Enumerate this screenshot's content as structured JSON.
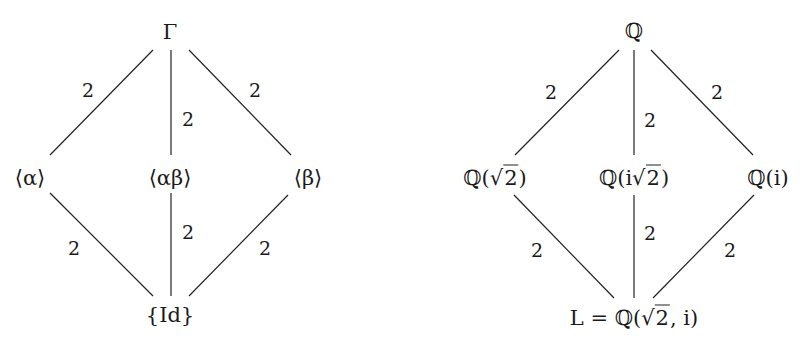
{
  "diagrams": [
    {
      "name": "galois-group-lattice",
      "nodes": {
        "top": "Γ",
        "left": "⟨α⟩",
        "middle": "⟨αβ⟩",
        "right": "⟨β⟩",
        "bottom": "{Id}"
      },
      "edges": [
        {
          "from": "top",
          "to": "left",
          "label": "2"
        },
        {
          "from": "top",
          "to": "middle",
          "label": "2"
        },
        {
          "from": "top",
          "to": "right",
          "label": "2"
        },
        {
          "from": "left",
          "to": "bottom",
          "label": "2"
        },
        {
          "from": "middle",
          "to": "bottom",
          "label": "2"
        },
        {
          "from": "right",
          "to": "bottom",
          "label": "2"
        }
      ]
    },
    {
      "name": "field-extension-lattice",
      "nodes": {
        "top": "ℚ",
        "left_prefix": "ℚ(",
        "left_rad": "2",
        "left_suffix": ")",
        "middle_prefix": "ℚ(i",
        "middle_rad": "2",
        "middle_suffix": ")",
        "right": "ℚ(i)",
        "bottom_prefix": "L = ℚ(",
        "bottom_rad": "2",
        "bottom_suffix": ", i)"
      },
      "edges": [
        {
          "from": "top",
          "to": "left",
          "label": "2"
        },
        {
          "from": "top",
          "to": "middle",
          "label": "2"
        },
        {
          "from": "top",
          "to": "right",
          "label": "2"
        },
        {
          "from": "left",
          "to": "bottom",
          "label": "2"
        },
        {
          "from": "middle",
          "to": "bottom",
          "label": "2"
        },
        {
          "from": "right",
          "to": "bottom",
          "label": "2"
        }
      ]
    }
  ]
}
